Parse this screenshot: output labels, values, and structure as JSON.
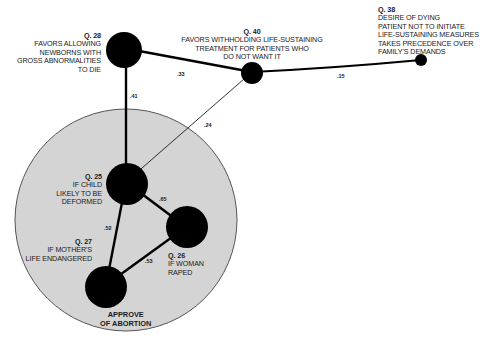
{
  "diagram": {
    "cluster": {
      "title_line1": "APPROVE",
      "title_line2": "OF ABORTION",
      "fill": "#d4d4d4",
      "stroke": "#555555"
    },
    "nodes": [
      {
        "id": "q28",
        "question": "Q. 28",
        "lines": [
          "FAVORS ALLOWING",
          "NEWBORNS WITH",
          "GROSS ABNORMALITIES",
          "TO DIE"
        ]
      },
      {
        "id": "q40",
        "question": "Q. 40",
        "lines": [
          "FAVORS WITHHOLDING LIFE-SUSTAINING",
          "TREATMENT FOR PATIENTS WHO",
          "DO NOT WANT IT"
        ]
      },
      {
        "id": "q38",
        "question": "Q. 38",
        "lines": [
          "DESIRE OF DYING",
          "PATIENT NOT TO INITIATE",
          "LIFE-SUSTAINING MEASURES",
          "TAKES PRECEDENCE OVER",
          "FAMILY'S DEMANDS"
        ]
      },
      {
        "id": "q25",
        "question": "Q. 25",
        "lines": [
          "IF CHILD",
          "LIKELY TO BE",
          "DEFORMED"
        ]
      },
      {
        "id": "q26",
        "question": "Q. 26",
        "lines": [
          "IF WOMAN",
          "RAPED"
        ]
      },
      {
        "id": "q27",
        "question": "Q. 27",
        "lines": [
          "IF MOTHER'S",
          "LIFE ENDANGERED"
        ]
      }
    ],
    "edges": [
      {
        "from": "q28",
        "to": "q40",
        "weight": ".33"
      },
      {
        "from": "q40",
        "to": "q38",
        "weight": ".15"
      },
      {
        "from": "q28",
        "to": "q25",
        "weight": ".41"
      },
      {
        "from": "q40",
        "to": "q25",
        "weight": ".24"
      },
      {
        "from": "q25",
        "to": "q26",
        "weight": ".65"
      },
      {
        "from": "q25",
        "to": "q27",
        "weight": ".52"
      },
      {
        "from": "q27",
        "to": "q26",
        "weight": ".53"
      }
    ]
  }
}
